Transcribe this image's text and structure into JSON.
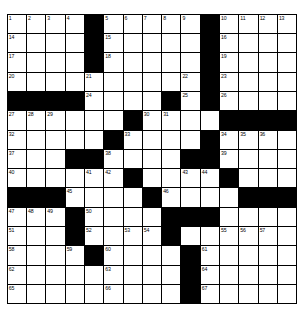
{
  "puzzle": {
    "title": "Crossword Grid",
    "type": "crossword",
    "rows": 15,
    "cols": 15,
    "cell_size_px": 19.3,
    "colors": {
      "background": "#ffffff",
      "block": "#000000",
      "grid_line": "#000000",
      "number_text": "#000000"
    },
    "blocks": [
      [
        0,
        4
      ],
      [
        0,
        10
      ],
      [
        1,
        4
      ],
      [
        1,
        10
      ],
      [
        2,
        4
      ],
      [
        2,
        10
      ],
      [
        3,
        10
      ],
      [
        4,
        0
      ],
      [
        4,
        1
      ],
      [
        4,
        2
      ],
      [
        4,
        3
      ],
      [
        4,
        8
      ],
      [
        4,
        10
      ],
      [
        5,
        6
      ],
      [
        5,
        11
      ],
      [
        5,
        12
      ],
      [
        5,
        13
      ],
      [
        5,
        14
      ],
      [
        6,
        5
      ],
      [
        6,
        10
      ],
      [
        7,
        3
      ],
      [
        7,
        4
      ],
      [
        7,
        9
      ],
      [
        7,
        10
      ],
      [
        8,
        6
      ],
      [
        8,
        11
      ],
      [
        9,
        0
      ],
      [
        9,
        1
      ],
      [
        9,
        2
      ],
      [
        9,
        7
      ],
      [
        9,
        12
      ],
      [
        9,
        13
      ],
      [
        9,
        14
      ],
      [
        10,
        3
      ],
      [
        10,
        8
      ],
      [
        10,
        9
      ],
      [
        10,
        10
      ],
      [
        11,
        3
      ],
      [
        11,
        8
      ],
      [
        12,
        4
      ],
      [
        12,
        9
      ],
      [
        13,
        9
      ],
      [
        14,
        9
      ]
    ],
    "numbers": [
      {
        "r": 0,
        "c": 0,
        "n": "1"
      },
      {
        "r": 0,
        "c": 1,
        "n": "2"
      },
      {
        "r": 0,
        "c": 2,
        "n": "3"
      },
      {
        "r": 0,
        "c": 3,
        "n": "4"
      },
      {
        "r": 0,
        "c": 5,
        "n": "5"
      },
      {
        "r": 0,
        "c": 6,
        "n": "6"
      },
      {
        "r": 0,
        "c": 7,
        "n": "7"
      },
      {
        "r": 0,
        "c": 8,
        "n": "8"
      },
      {
        "r": 0,
        "c": 9,
        "n": "9"
      },
      {
        "r": 0,
        "c": 11,
        "n": "10"
      },
      {
        "r": 0,
        "c": 12,
        "n": "11"
      },
      {
        "r": 0,
        "c": 13,
        "n": "12"
      },
      {
        "r": 0,
        "c": 14,
        "n": "13"
      },
      {
        "r": 1,
        "c": 0,
        "n": "14"
      },
      {
        "r": 1,
        "c": 5,
        "n": "15"
      },
      {
        "r": 1,
        "c": 11,
        "n": "16"
      },
      {
        "r": 2,
        "c": 0,
        "n": "17"
      },
      {
        "r": 2,
        "c": 5,
        "n": "18"
      },
      {
        "r": 2,
        "c": 11,
        "n": "19"
      },
      {
        "r": 3,
        "c": 0,
        "n": "20"
      },
      {
        "r": 3,
        "c": 4,
        "n": "21"
      },
      {
        "r": 3,
        "c": 9,
        "n": "22"
      },
      {
        "r": 3,
        "c": 11,
        "n": "23"
      },
      {
        "r": 4,
        "c": 4,
        "n": "24"
      },
      {
        "r": 4,
        "c": 9,
        "n": "25"
      },
      {
        "r": 4,
        "c": 11,
        "n": "26"
      },
      {
        "r": 5,
        "c": 0,
        "n": "27"
      },
      {
        "r": 5,
        "c": 1,
        "n": "28"
      },
      {
        "r": 5,
        "c": 2,
        "n": "29"
      },
      {
        "r": 5,
        "c": 7,
        "n": "30"
      },
      {
        "r": 5,
        "c": 8,
        "n": "31"
      },
      {
        "r": 6,
        "c": 0,
        "n": "32"
      },
      {
        "r": 6,
        "c": 6,
        "n": "33"
      },
      {
        "r": 6,
        "c": 11,
        "n": "34"
      },
      {
        "r": 6,
        "c": 12,
        "n": "35"
      },
      {
        "r": 6,
        "c": 13,
        "n": "36"
      },
      {
        "r": 7,
        "c": 0,
        "n": "37"
      },
      {
        "r": 7,
        "c": 5,
        "n": "38"
      },
      {
        "r": 7,
        "c": 11,
        "n": "39"
      },
      {
        "r": 8,
        "c": 0,
        "n": "40"
      },
      {
        "r": 8,
        "c": 4,
        "n": "41"
      },
      {
        "r": 8,
        "c": 5,
        "n": "42"
      },
      {
        "r": 8,
        "c": 9,
        "n": "43"
      },
      {
        "r": 8,
        "c": 10,
        "n": "44"
      },
      {
        "r": 9,
        "c": 3,
        "n": "45"
      },
      {
        "r": 9,
        "c": 8,
        "n": "46"
      },
      {
        "r": 10,
        "c": 0,
        "n": "47"
      },
      {
        "r": 10,
        "c": 1,
        "n": "48"
      },
      {
        "r": 10,
        "c": 2,
        "n": "49"
      },
      {
        "r": 10,
        "c": 4,
        "n": "50"
      },
      {
        "r": 11,
        "c": 0,
        "n": "51"
      },
      {
        "r": 11,
        "c": 4,
        "n": "52"
      },
      {
        "r": 11,
        "c": 6,
        "n": "53"
      },
      {
        "r": 11,
        "c": 7,
        "n": "54"
      },
      {
        "r": 11,
        "c": 11,
        "n": "55"
      },
      {
        "r": 11,
        "c": 12,
        "n": "56"
      },
      {
        "r": 11,
        "c": 13,
        "n": "57"
      },
      {
        "r": 12,
        "c": 0,
        "n": "58"
      },
      {
        "r": 12,
        "c": 3,
        "n": "59"
      },
      {
        "r": 12,
        "c": 5,
        "n": "60"
      },
      {
        "r": 12,
        "c": 10,
        "n": "61"
      },
      {
        "r": 13,
        "c": 0,
        "n": "62"
      },
      {
        "r": 13,
        "c": 5,
        "n": "63"
      },
      {
        "r": 13,
        "c": 10,
        "n": "64"
      },
      {
        "r": 14,
        "c": 0,
        "n": "65"
      },
      {
        "r": 14,
        "c": 5,
        "n": "66"
      },
      {
        "r": 14,
        "c": 10,
        "n": "67"
      }
    ],
    "entries": []
  }
}
